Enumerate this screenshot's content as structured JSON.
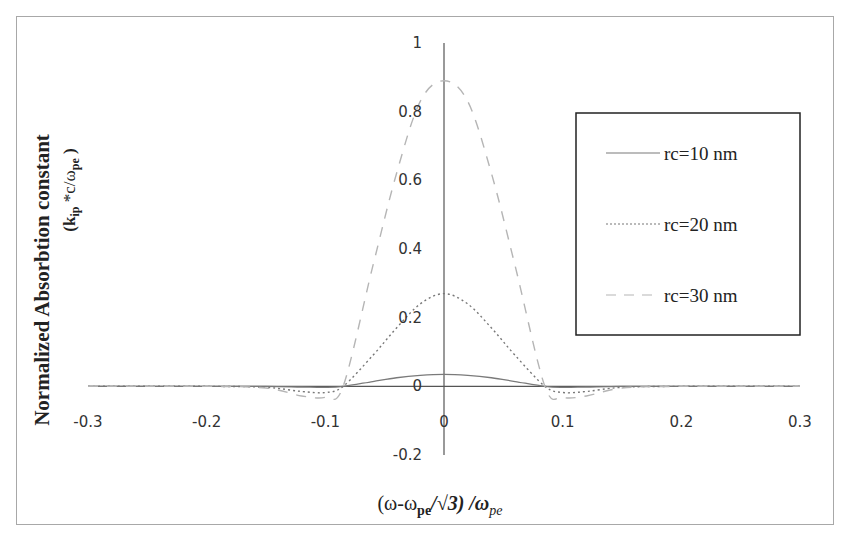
{
  "chart_data": {
    "type": "line",
    "title": "",
    "xlabel": "(ω-ωpe/√3) /ωpe",
    "ylabel": "Normalized Absorbtion constant (kip*c/ωpe)",
    "ylabel_line1": "Normalized Absorbtion constant",
    "ylabel_line2": "(k",
    "ylabel_line2_sub": "ip",
    "ylabel_line2_rest": " *c/ω",
    "ylabel_line2_sub2": "pe",
    "ylabel_line2_end": " )",
    "xlabel_parts": {
      "a": "(ω-ω",
      "sub": "pe",
      "b": "/√3) /ω",
      "sub2": "pe"
    },
    "xlim": [
      -0.3,
      0.3
    ],
    "ylim": [
      -0.2,
      1
    ],
    "x_ticks": [
      "-0.3",
      "-0.2",
      "-0.1",
      "0",
      "0.1",
      "0.2",
      "0.3"
    ],
    "y_ticks": [
      "1",
      "0.8",
      "0.6",
      "0.4",
      "0.2",
      "0",
      "-0.2"
    ],
    "grid": false,
    "legend_position": "right",
    "x": [
      -0.3,
      -0.2,
      -0.15,
      -0.12,
      -0.1,
      -0.085,
      -0.06,
      -0.04,
      -0.02,
      0,
      0.02,
      0.04,
      0.06,
      0.085,
      0.1,
      0.12,
      0.15,
      0.2,
      0.3
    ],
    "series": [
      {
        "name": "rc=10 nm",
        "style": "solid",
        "values": [
          0,
          0,
          0,
          -0.002,
          -0.003,
          0,
          0.014,
          0.025,
          0.032,
          0.035,
          0.032,
          0.025,
          0.014,
          0,
          -0.003,
          -0.002,
          0,
          0,
          0
        ]
      },
      {
        "name": "rc=20 nm",
        "style": "dotted",
        "values": [
          0,
          0,
          -0.003,
          -0.015,
          -0.018,
          0,
          0.09,
          0.17,
          0.24,
          0.27,
          0.24,
          0.17,
          0.09,
          0,
          -0.018,
          -0.015,
          -0.003,
          0,
          0
        ]
      },
      {
        "name": "rc=30 nm",
        "style": "dashed",
        "values": [
          0,
          0,
          -0.005,
          -0.028,
          -0.032,
          0,
          0.35,
          0.62,
          0.83,
          0.89,
          0.83,
          0.62,
          0.35,
          0,
          -0.032,
          -0.028,
          -0.005,
          0,
          0
        ]
      }
    ]
  },
  "legend": {
    "items": [
      {
        "label": "rc=10 nm",
        "style": "solid"
      },
      {
        "label": "rc=20 nm",
        "style": "dotted"
      },
      {
        "label": "rc=30 nm",
        "style": "dashed"
      }
    ]
  },
  "colors": {
    "axis": "#555555",
    "rc10": "#7a7a7a",
    "rc20": "#777777",
    "rc30": "#b5b5b5",
    "legend_border": "#222222",
    "frame": "#a8a8a8"
  }
}
